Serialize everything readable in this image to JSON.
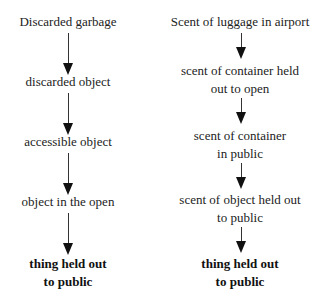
{
  "left_chain": {
    "nodes": [
      {
        "label": "Discarded garbage"
      },
      {
        "label": "discarded object"
      },
      {
        "label": "accessible object"
      },
      {
        "label": "object in the open"
      },
      {
        "label_line1": "thing held out",
        "label_line2": "to public"
      }
    ]
  },
  "right_chain": {
    "nodes": [
      {
        "label": "Scent of luggage in airport"
      },
      {
        "label_line1": "scent of container held",
        "label_line2": "out to open"
      },
      {
        "label_line1": "scent of container",
        "label_line2": "in public"
      },
      {
        "label_line1": "scent of object held out",
        "label_line2": "to public"
      },
      {
        "label_line1": "thing held out",
        "label_line2": "to public"
      }
    ]
  },
  "colors": {
    "text": "#222222",
    "arrow": "#111111",
    "background": "#ffffff"
  }
}
